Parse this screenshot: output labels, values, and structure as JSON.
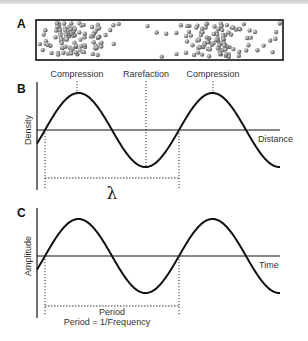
{
  "panels": {
    "a": {
      "letter": "A"
    },
    "b": {
      "letter": "B",
      "ylabel": "Density",
      "xlabel": "Distance",
      "annotations": [
        "Compression",
        "Rarefaction",
        "Compression"
      ],
      "bracket_label": "λ"
    },
    "c": {
      "letter": "C",
      "ylabel": "Amplitude",
      "xlabel": "Time",
      "bracket_label": "Period",
      "formula": "Period = 1/Frequency"
    }
  },
  "colors": {
    "line": "#1a1a1a",
    "particle": "#8a8a8a",
    "text": "#333333"
  }
}
